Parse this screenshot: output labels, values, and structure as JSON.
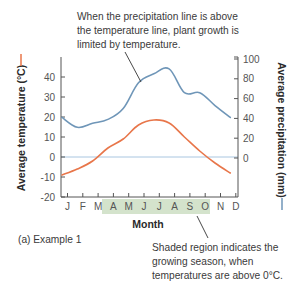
{
  "chart_data": {
    "type": "line",
    "title": "",
    "caption": "(a) Example 1",
    "xlabel": "Month",
    "categories": [
      "J",
      "F",
      "M",
      "A",
      "M",
      "J",
      "J",
      "A",
      "S",
      "O",
      "N",
      "D"
    ],
    "series": [
      {
        "name": "Average temperature (°C)",
        "axis": "left",
        "color": "#e8764a",
        "values": [
          -9,
          -6,
          -2,
          4.5,
          9,
          16,
          18.5,
          17,
          10,
          3,
          -3,
          -8
        ]
      },
      {
        "name": "Average precipitation (mm)",
        "axis": "right",
        "color": "#6f96b8",
        "values": [
          41,
          31,
          35,
          39,
          50,
          76,
          85,
          90,
          66,
          66,
          53,
          41
        ]
      }
    ],
    "left_axis": {
      "label": "Average temperature (°C)",
      "ylim": [
        -20,
        50
      ],
      "ticks": [
        -20,
        -10,
        0,
        10,
        20,
        30,
        40
      ]
    },
    "right_axis": {
      "label": "Average precipitation (mm)",
      "ylim": [
        0,
        100
      ],
      "ticks": [
        0,
        20,
        40,
        60,
        80,
        100
      ]
    },
    "zero_line": {
      "value": 0,
      "color": "#a9c6e0"
    },
    "shaded_region": {
      "from": "A",
      "to": "O",
      "color": "#d4e3cc",
      "meaning": "growing season"
    },
    "annotations": [
      {
        "lines": [
          "When the precipitation line is above",
          "the temperature line, plant growth is",
          "limited by temperature."
        ]
      },
      {
        "lines": [
          "Shaded region indicates the",
          "growing season, when",
          "temperatures are above 0°C."
        ]
      }
    ],
    "grid": false,
    "legend": "inline dashes beside axis labels"
  }
}
